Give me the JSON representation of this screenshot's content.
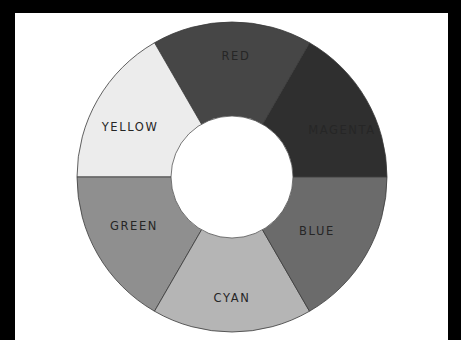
{
  "wheel": {
    "center": [
      232,
      177
    ],
    "outer_radius": 155,
    "inner_radius": 61,
    "segments": [
      {
        "label": "MAGENTA",
        "start_deg": 0,
        "end_deg": 60,
        "color": "#2f2f2f",
        "label_pos": [
          342,
          134
        ]
      },
      {
        "label": "RED",
        "start_deg": 60,
        "end_deg": 120,
        "color": "#464646",
        "label_pos": [
          236,
          60
        ]
      },
      {
        "label": "YELLOW",
        "start_deg": 120,
        "end_deg": 180,
        "color": "#ececec",
        "label_pos": [
          130,
          131
        ]
      },
      {
        "label": "GREEN",
        "start_deg": 180,
        "end_deg": 240,
        "color": "#8f8f8f",
        "label_pos": [
          134,
          230
        ]
      },
      {
        "label": "CYAN",
        "start_deg": 240,
        "end_deg": 300,
        "color": "#b5b5b5",
        "label_pos": [
          232,
          302
        ]
      },
      {
        "label": "BLUE",
        "start_deg": 300,
        "end_deg": 360,
        "color": "#6b6b6b",
        "label_pos": [
          317,
          235
        ]
      }
    ],
    "divider_color": "#3a3a3a",
    "hole_color": "#ffffff"
  }
}
